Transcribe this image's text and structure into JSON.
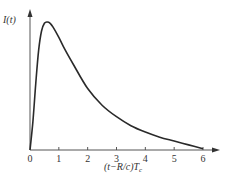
{
  "chart_data": {
    "type": "line",
    "title": "",
    "xlabel": "(t−R/c)T",
    "xlabel_sub": "c",
    "ylabel": "I(t)",
    "xlim": [
      0,
      6
    ],
    "ylim": [
      0,
      1
    ],
    "x_ticks": [
      "0",
      "1",
      "2",
      "3",
      "4",
      "5",
      "6"
    ],
    "grid": false,
    "legend": "none",
    "series": [
      {
        "name": "I(t)",
        "x": [
          0,
          0.1,
          0.2,
          0.3,
          0.4,
          0.5,
          0.6,
          0.7,
          0.8,
          1.0,
          1.2,
          1.5,
          2.0,
          2.5,
          3.0,
          3.5,
          4.0,
          4.5,
          5.0,
          5.5,
          6.0
        ],
        "y": [
          0,
          0.22,
          0.52,
          0.78,
          0.93,
          0.99,
          1.0,
          0.99,
          0.96,
          0.88,
          0.79,
          0.67,
          0.48,
          0.35,
          0.26,
          0.19,
          0.14,
          0.1,
          0.07,
          0.04,
          0.01
        ]
      }
    ]
  }
}
